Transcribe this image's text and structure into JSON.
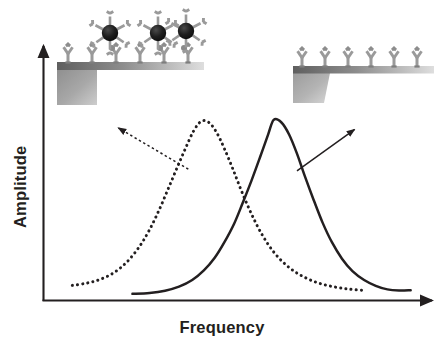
{
  "figure": {
    "type": "scientific-schematic-chart",
    "background_color": "#ffffff",
    "axis_color": "#231f20",
    "curve_color": "#231f20"
  },
  "axes": {
    "x_label": "Frequency",
    "y_label": "Amplitude",
    "x_axis_name": "x-axis-arrow",
    "y_axis_name": "y-axis-arrow",
    "ticks_shown": false,
    "tick_labels": []
  },
  "chart_data": {
    "type": "line",
    "title": "",
    "subtitle": "",
    "xlabel": "Frequency",
    "ylabel": "Amplitude",
    "xlim": [
      0,
      1
    ],
    "ylim": [
      0,
      1
    ],
    "grid": false,
    "legend_position": "none",
    "axis_tick_labels": {
      "x": [],
      "y": []
    },
    "annotations": [
      {
        "name": "arrow-to-loaded-cantilever",
        "style": "dotted",
        "from_x": 0.372,
        "from_y": 0.59,
        "to_x": 0.192,
        "to_y": 0.775,
        "points_to": "left-inset-loaded-cantilever"
      },
      {
        "name": "arrow-to-bare-cantilever",
        "style": "solid",
        "from_x": 0.652,
        "from_y": 0.583,
        "to_x": 0.8,
        "to_y": 0.768,
        "points_to": "right-inset-bare-cantilever"
      }
    ],
    "series": [
      {
        "name": "Mass-loaded cantilever (lower frequency)",
        "style": "dotted",
        "color": "#231f20",
        "peak_x": 0.405,
        "peak_y": 0.805,
        "baseline_y": 0.045,
        "x": [
          0.073,
          0.11,
          0.145,
          0.18,
          0.213,
          0.245,
          0.272,
          0.298,
          0.322,
          0.345,
          0.365,
          0.385,
          0.405,
          0.425,
          0.445,
          0.465,
          0.487,
          0.51,
          0.535,
          0.562,
          0.592,
          0.625,
          0.66,
          0.7,
          0.74,
          0.782,
          0.82
        ],
        "y": [
          0.068,
          0.078,
          0.095,
          0.125,
          0.172,
          0.24,
          0.318,
          0.412,
          0.51,
          0.605,
          0.685,
          0.76,
          0.805,
          0.8,
          0.755,
          0.682,
          0.59,
          0.488,
          0.388,
          0.296,
          0.218,
          0.158,
          0.115,
          0.083,
          0.064,
          0.052,
          0.046
        ]
      },
      {
        "name": "Bare cantilever (higher frequency)",
        "style": "solid",
        "color": "#231f20",
        "peak_x": 0.592,
        "peak_y": 0.812,
        "baseline_y": 0.03,
        "x": [
          0.228,
          0.272,
          0.312,
          0.348,
          0.382,
          0.412,
          0.44,
          0.465,
          0.49,
          0.512,
          0.535,
          0.557,
          0.578,
          0.592,
          0.612,
          0.632,
          0.652,
          0.672,
          0.695,
          0.718,
          0.742,
          0.768,
          0.795,
          0.825,
          0.855,
          0.885,
          0.915,
          0.945
        ],
        "y": [
          0.03,
          0.034,
          0.044,
          0.062,
          0.092,
          0.135,
          0.192,
          0.262,
          0.345,
          0.438,
          0.54,
          0.645,
          0.748,
          0.812,
          0.8,
          0.745,
          0.66,
          0.56,
          0.452,
          0.35,
          0.262,
          0.188,
          0.132,
          0.092,
          0.066,
          0.05,
          0.045,
          0.046
        ]
      }
    ]
  },
  "insets": {
    "left": {
      "name": "left-inset-loaded-cantilever",
      "caption": "",
      "description": "Cantilever beam with antibodies and bound nanoparticle-antibody conjugates",
      "beam_color_start": "#6e6e6e",
      "beam_color_end": "#d8d8d8",
      "block_color_start": "#8a8a8a",
      "block_color_end": "#cfcfcf",
      "antibody_color": "#9a9a9a",
      "nanoparticle_color": "#1c1c1c",
      "antibody_count": 6,
      "nanoparticle_count": 3
    },
    "right": {
      "name": "right-inset-bare-cantilever",
      "caption": "",
      "description": "Cantilever beam with antibodies only, no bound mass",
      "beam_color_start": "#6e6e6e",
      "beam_color_end": "#d8d8d8",
      "block_color_start": "#9a9a9a",
      "block_color_end": "#d4d4d4",
      "antibody_color": "#9a9a9a",
      "antibody_count": 6,
      "nanoparticle_count": 0
    }
  }
}
